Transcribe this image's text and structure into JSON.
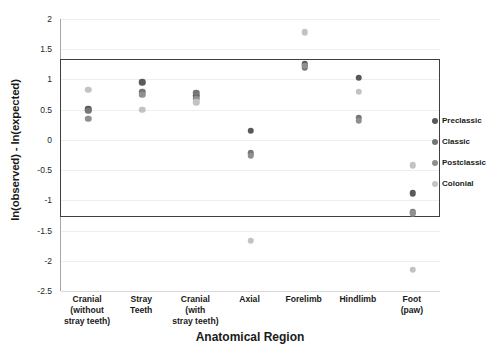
{
  "chart_data": {
    "type": "scatter",
    "title": "",
    "xlabel": "Anatomical Region",
    "ylabel": "ln(observed) - ln(expected)",
    "ylim": [
      -2.5,
      2
    ],
    "ytick_step": 0.5,
    "yticks": [
      "2",
      "1.5",
      "1",
      "0.5",
      "0",
      "-0.5",
      "-1",
      "-1.5",
      "-2",
      "-2.5"
    ],
    "grid": true,
    "legend_position": "right",
    "categories": [
      "Cranial\n(without\nstray teeth)",
      "Stray\nTeeth",
      "Cranial\n(with\nstray teeth)",
      "Axial",
      "Forelimb",
      "Hindlimb",
      "Foot\n(paw)"
    ],
    "series": [
      {
        "name": "Preclassic",
        "color": "#595959",
        "points": [
          {
            "category": 0,
            "value": 0.51
          },
          {
            "category": 1,
            "value": 0.95
          },
          {
            "category": 2,
            "value": 0.73
          },
          {
            "category": 3,
            "value": 0.15
          },
          {
            "category": 4,
            "value": 1.25
          },
          {
            "category": 5,
            "value": 1.03
          },
          {
            "category": 6,
            "value": -0.88
          }
        ]
      },
      {
        "name": "Classic",
        "color": "#767676",
        "points": [
          {
            "category": 0,
            "value": 0.48
          },
          {
            "category": 1,
            "value": 0.8
          },
          {
            "category": 2,
            "value": 0.78
          },
          {
            "category": 3,
            "value": -0.22
          },
          {
            "category": 4,
            "value": 1.2
          },
          {
            "category": 5,
            "value": 0.37
          },
          {
            "category": 6,
            "value": -1.2
          }
        ]
      },
      {
        "name": "Postclassic",
        "color": "#909090",
        "points": [
          {
            "category": 0,
            "value": 0.35
          },
          {
            "category": 1,
            "value": 0.75
          },
          {
            "category": 2,
            "value": 0.68
          },
          {
            "category": 3,
            "value": -0.26
          },
          {
            "category": 4,
            "value": 1.23
          },
          {
            "category": 5,
            "value": 0.32
          },
          {
            "category": 6,
            "value": -1.21
          }
        ]
      },
      {
        "name": "Colonial",
        "color": "#c3c3c3",
        "points": [
          {
            "category": 0,
            "value": 0.83
          },
          {
            "category": 1,
            "value": 0.5
          },
          {
            "category": 2,
            "value": 0.62
          },
          {
            "category": 3,
            "value": -1.67
          },
          {
            "category": 4,
            "value": 1.78
          },
          {
            "category": 5,
            "value": 0.8
          },
          {
            "category": 6,
            "value": -0.42
          },
          {
            "category": 6,
            "value": -2.15
          }
        ]
      }
    ],
    "annotations": [
      {
        "name": "highlight-rectangle",
        "type": "rect",
        "y_top": 1.33,
        "y_bottom": -1.28,
        "color": "#3f3f3f"
      }
    ]
  },
  "legend": {
    "items": [
      {
        "label": "Preclassic",
        "color": "#595959"
      },
      {
        "label": "Classic",
        "color": "#767676"
      },
      {
        "label": "Postclassic",
        "color": "#909090"
      },
      {
        "label": "Colonial",
        "color": "#c3c3c3"
      }
    ]
  }
}
